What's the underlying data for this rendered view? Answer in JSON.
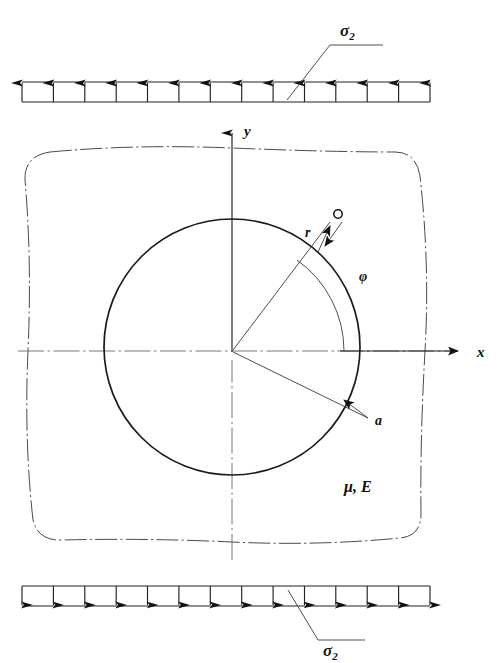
{
  "figure": {
    "labels": {
      "sigma_top": "σ",
      "sigma_top_sub": "2",
      "sigma_bottom": "σ",
      "sigma_bottom_sub": "2",
      "axis_y": "y",
      "axis_x": "x",
      "radius_r": "r",
      "angle_phi": "φ",
      "hole_radius_a": "a",
      "material": "μ, E"
    },
    "colors": {
      "background": "#ffffff",
      "line": "#222222",
      "hole_outline": "#1a1a1a",
      "plate_boundary": "#4a4a4a",
      "centerline": "#6a6a6a",
      "text": "#111111"
    },
    "geometry": {
      "origin": {
        "x": 232,
        "y": 351
      },
      "hole_radius_px": 128,
      "phi_arc_radius_px": 112,
      "phi_degrees": 55,
      "point_marker": {
        "x": 337,
        "y": 215,
        "radius_px": 4
      },
      "top_band": {
        "x_start": 22,
        "x_end": 430,
        "y_top": 82,
        "y_bottom": 102,
        "arrow_count": 14,
        "direction": "up"
      },
      "bottom_band": {
        "x_start": 22,
        "x_end": 430,
        "y_top": 586,
        "y_bottom": 606,
        "arrow_count": 14,
        "direction": "down"
      },
      "plate_box": {
        "left": 20,
        "right": 425,
        "top": 152,
        "bottom": 540,
        "corner_radius_px": 30,
        "edge_bow_px": 9
      },
      "x_axis": {
        "x_start": 18,
        "x_end": 463,
        "y": 351
      },
      "y_axis": {
        "x": 232,
        "y_start": 128,
        "y_end": 565
      }
    },
    "annotations": [
      {
        "name": "sigma-top",
        "text": "σ₂",
        "x": 352,
        "y": 32,
        "leader_from": [
          287,
          100
        ],
        "leader_to": [
          330,
          45
        ]
      },
      {
        "name": "sigma-bottom",
        "text": "σ₂",
        "x": 290,
        "y": 654,
        "leader_from": [
          288,
          590
        ],
        "leader_to": [
          318,
          640
        ]
      },
      {
        "name": "radius-r",
        "text": "r",
        "x": 306,
        "y": 233
      },
      {
        "name": "angle-phi",
        "text": "φ",
        "x": 360,
        "y": 277
      },
      {
        "name": "hole-radius-a",
        "text": "a",
        "x": 377,
        "y": 422
      },
      {
        "name": "material",
        "text": "μ, E",
        "x": 344,
        "y": 491
      },
      {
        "name": "axis-y",
        "text": "y",
        "x": 244,
        "y": 134
      },
      {
        "name": "axis-x",
        "text": "x",
        "x": 477,
        "y": 357
      }
    ]
  }
}
